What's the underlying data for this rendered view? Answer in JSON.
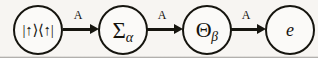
{
  "figure": {
    "type": "process-flow-diagram",
    "background_color": "#f7f5f2",
    "stroke_color": "#16150f",
    "nodes": [
      {
        "id": "state",
        "label": "|↑⟩⟨↑|",
        "subscript": "",
        "shape": "circle"
      },
      {
        "id": "sigma",
        "label": "Σ",
        "subscript": "α",
        "shape": "circle"
      },
      {
        "id": "theta",
        "label": "Θ",
        "subscript": "β",
        "shape": "circle"
      },
      {
        "id": "e",
        "label": "e",
        "subscript": "",
        "shape": "circle"
      }
    ],
    "edges": [
      {
        "id": "edge-1",
        "from": "state",
        "to": "sigma",
        "label": "A"
      },
      {
        "id": "edge-2",
        "from": "sigma",
        "to": "theta",
        "label": "A"
      },
      {
        "id": "edge-3",
        "from": "theta",
        "to": "e",
        "label": "A"
      }
    ]
  }
}
